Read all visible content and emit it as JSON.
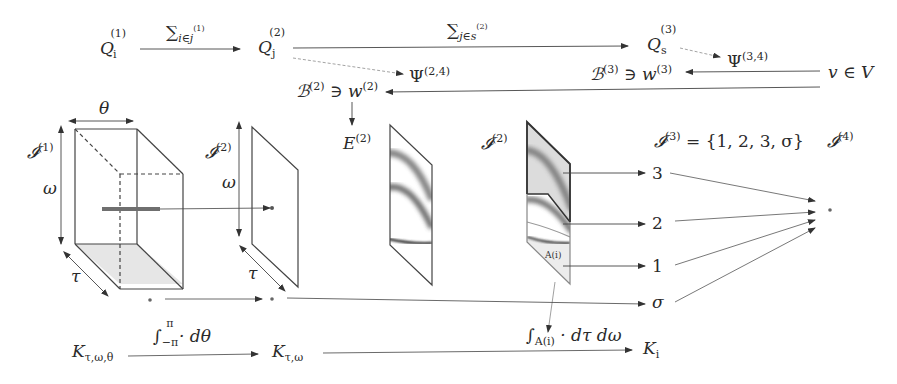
{
  "diagram": {
    "top_row": {
      "q1": {
        "base": "Q",
        "sub": "i",
        "sup": "(1)"
      },
      "sum1": {
        "symbol": "∑",
        "sub": "i∈j",
        "sub_sup": "(1)"
      },
      "q2": {
        "base": "Q",
        "sub": "j",
        "sup": "(2)"
      },
      "sum2": {
        "symbol": "∑",
        "sub": "j∈s",
        "sub_sup": "(2)"
      },
      "q3": {
        "base": "Q",
        "sub": "s",
        "sup": "(3)"
      },
      "psi24": {
        "base": "Ψ",
        "sup": "(2,4)"
      },
      "psi34": {
        "base": "Ψ",
        "sup": "(3,4)"
      },
      "b2": {
        "text": "ℬ",
        "sup": "(2)",
        "rel": " ∋ w",
        "rel_sup": "(2)"
      },
      "b3": {
        "text": "ℬ",
        "sup": "(3)",
        "rel": " ∋ w",
        "rel_sup": "(3)"
      },
      "v": {
        "text": "v ∈ V"
      }
    },
    "middle": {
      "i1": {
        "base": "𝓘",
        "sup": "(1)"
      },
      "theta": "θ",
      "omega1": "ω",
      "tau1": "τ",
      "i2_left": {
        "base": "𝓘",
        "sup": "(2)"
      },
      "omega2": "ω",
      "tau2": "τ",
      "e2": {
        "base": "E",
        "sup": "(2)"
      },
      "i2_right": {
        "base": "𝓘",
        "sup": "(2)"
      },
      "region_label": "A(i)",
      "i3": {
        "base": "𝓘",
        "sup": "(3)",
        "rest": " = {1, 2, 3, σ}"
      },
      "i4": {
        "base": "𝓘",
        "sup": "(4)"
      },
      "outputs": [
        "3",
        "2",
        "1",
        "σ"
      ]
    },
    "bottom_row": {
      "k1": {
        "base": "K",
        "sub": "τ,ω,θ"
      },
      "int1": {
        "symbol": "∫",
        "lower": "−π",
        "upper": "π",
        "rest": " · dθ"
      },
      "k2": {
        "base": "K",
        "sub": "τ,ω"
      },
      "int2": {
        "symbol": "∫",
        "lower": "A(i)",
        "rest": " · dτ dω"
      },
      "k3": {
        "base": "K",
        "sub": "i"
      }
    },
    "colors": {
      "stroke": "#3a3a3a",
      "light_stroke": "#777777",
      "dashed": "#9a9a9a",
      "shade": "#e4e4e4",
      "bar": "#6f6f6f"
    }
  }
}
